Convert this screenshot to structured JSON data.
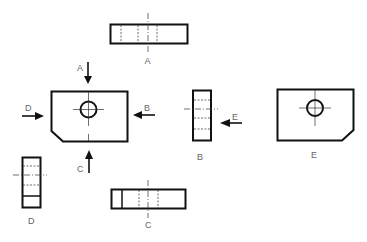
{
  "figure": {
    "arrows": [
      {
        "id": "A",
        "label": "A",
        "direction": "down"
      },
      {
        "id": "B",
        "label": "B",
        "direction": "left"
      },
      {
        "id": "C",
        "label": "C",
        "direction": "up"
      },
      {
        "id": "D",
        "label": "D",
        "direction": "right"
      },
      {
        "id": "E",
        "label": "E",
        "direction": "left"
      }
    ],
    "views": [
      {
        "id": "A",
        "label": "A"
      },
      {
        "id": "B",
        "label": "B"
      },
      {
        "id": "C",
        "label": "C"
      },
      {
        "id": "D",
        "label": "D"
      },
      {
        "id": "E",
        "label": "E"
      }
    ]
  }
}
